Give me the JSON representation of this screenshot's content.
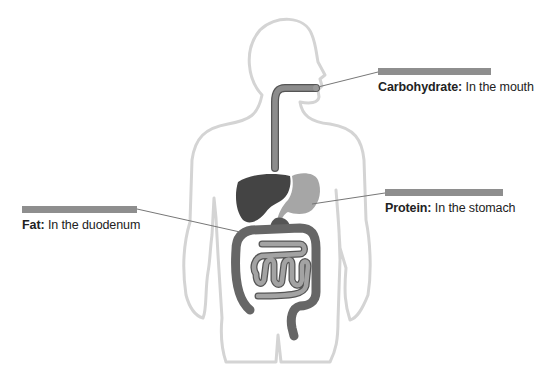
{
  "diagram": {
    "labels": [
      {
        "id": "carbohydrate",
        "nutrient": "Carbohydrate:",
        "location": "In the mouth"
      },
      {
        "id": "protein",
        "nutrient": "Protein:",
        "location": "In the stomach"
      },
      {
        "id": "fat",
        "nutrient": "Fat:",
        "location": "In the duodenum"
      }
    ],
    "colors": {
      "outline": "#d4d4d4",
      "liver": "#444444",
      "stomach": "#a6a6a6",
      "esophagus": "#888888",
      "large_intestine": "#666666",
      "small_intestine": "#9a9a9a",
      "label_bar": "#8e8e8e",
      "leader_line": "#777777"
    }
  }
}
